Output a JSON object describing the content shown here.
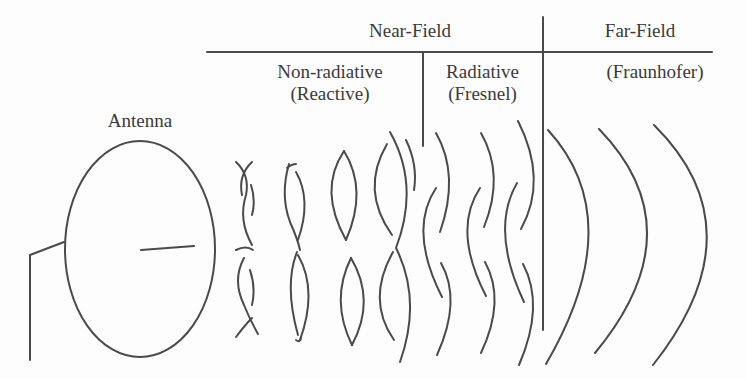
{
  "diagram": {
    "header": {
      "near_field": "Near-Field",
      "far_field": "Far-Field"
    },
    "subheader": {
      "non_radiative_line1": "Non-radiative",
      "non_radiative_line2": "(Reactive)",
      "radiative_line1": "Radiative",
      "radiative_line2": "(Fresnel)",
      "far_field_sub": "(Fraunhofer)"
    },
    "antenna_label": "Antenna",
    "colors": {
      "line": "#4a4a4a",
      "text": "#3a3a3a",
      "background": "#fdfdfd"
    }
  }
}
